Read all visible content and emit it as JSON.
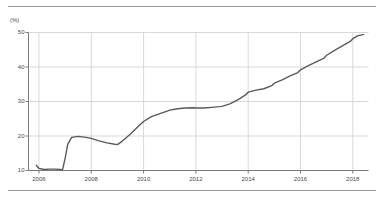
{
  "figure": {
    "unit_label": "(%)",
    "line_color": "#5a5a5a",
    "grid_color": "#cfcfcf",
    "axis_color": "#7a7a7a",
    "rule_color": "#9a9a9a",
    "background": "#ffffff"
  },
  "chart_data": {
    "type": "line",
    "title": "",
    "subtitle": "",
    "xlabel": "",
    "ylabel": "(%)",
    "ylim": [
      10,
      50
    ],
    "xlim": [
      2005.6,
      2018.6
    ],
    "yticks": [
      10,
      20,
      30,
      40,
      50
    ],
    "ytick_labels": [
      "10",
      "20",
      "30",
      "40",
      "50"
    ],
    "xticks": [
      2006,
      2008,
      2010,
      2012,
      2014,
      2016,
      2018
    ],
    "xtick_labels": [
      "2006",
      "2008",
      "2010",
      "2012",
      "2014",
      "2016",
      "2018"
    ],
    "grid": true,
    "grid_axis": "both",
    "legend": false,
    "legend_position": "none",
    "series": [
      {
        "name": "share",
        "color": "#5a5a5a",
        "x": [
          2005.9,
          2006.0,
          2006.2,
          2006.4,
          2006.6,
          2006.8,
          2006.9,
          2007.0,
          2007.1,
          2007.25,
          2007.5,
          2007.8,
          2008.0,
          2008.3,
          2008.6,
          2008.9,
          2009.0,
          2009.2,
          2009.5,
          2009.8,
          2010.0,
          2010.3,
          2010.6,
          2010.9,
          2011.0,
          2011.3,
          2011.6,
          2011.9,
          2012.0,
          2012.3,
          2012.6,
          2012.9,
          2013.0,
          2013.3,
          2013.6,
          2013.9,
          2014.0,
          2014.3,
          2014.6,
          2014.9,
          2015.0,
          2015.3,
          2015.6,
          2015.9,
          2016.0,
          2016.3,
          2016.6,
          2016.9,
          2017.0,
          2017.3,
          2017.6,
          2017.9,
          2018.0,
          2018.2,
          2018.4
        ],
        "y": [
          11.5,
          10.6,
          10.3,
          10.4,
          10.4,
          10.3,
          10.2,
          13.5,
          17.6,
          19.6,
          19.9,
          19.6,
          19.3,
          18.6,
          18.0,
          17.6,
          17.5,
          18.6,
          20.6,
          22.8,
          24.2,
          25.6,
          26.4,
          27.2,
          27.5,
          27.9,
          28.1,
          28.2,
          28.1,
          28.1,
          28.3,
          28.5,
          28.6,
          29.3,
          30.5,
          31.9,
          32.7,
          33.3,
          33.7,
          34.6,
          35.3,
          36.3,
          37.4,
          38.4,
          39.2,
          40.4,
          41.5,
          42.6,
          43.4,
          44.8,
          46.1,
          47.4,
          48.2,
          49.1,
          49.4
        ]
      }
    ]
  }
}
